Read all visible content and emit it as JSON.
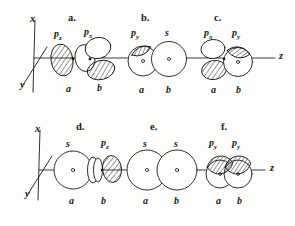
{
  "figure": {
    "background_color": "#fdfdfb",
    "ink_color": "#1a1a18"
  },
  "axes": {
    "row1": {
      "x_label": "x",
      "y_label": "y",
      "z_label": "z"
    },
    "row2": {
      "x_label": "x",
      "y_label": "y",
      "z_label": "z"
    }
  },
  "panels": [
    {
      "id": "panel-a",
      "letter": "a.",
      "orbital_labels": [
        "p",
        "p"
      ],
      "orbital_subscripts": [
        "z",
        "x"
      ],
      "site_labels": [
        "a",
        "b"
      ],
      "row": 1
    },
    {
      "id": "panel-b",
      "letter": "b.",
      "orbital_labels": [
        "p",
        "s"
      ],
      "orbital_subscripts": [
        "y",
        ""
      ],
      "site_labels": [
        "a",
        "b"
      ],
      "row": 1
    },
    {
      "id": "panel-c",
      "letter": "c.",
      "orbital_labels": [
        "p",
        "p"
      ],
      "orbital_subscripts": [
        "x",
        "y"
      ],
      "site_labels": [
        "a",
        "b"
      ],
      "row": 1
    },
    {
      "id": "panel-d",
      "letter": "d.",
      "orbital_labels": [
        "s",
        "p"
      ],
      "orbital_subscripts": [
        "",
        "z"
      ],
      "site_labels": [
        "a",
        "b"
      ],
      "row": 2
    },
    {
      "id": "panel-e",
      "letter": "e.",
      "orbital_labels": [
        "s",
        "s"
      ],
      "orbital_subscripts": [
        "",
        ""
      ],
      "site_labels": [
        "a",
        "b"
      ],
      "row": 2
    },
    {
      "id": "panel-f",
      "letter": "f.",
      "orbital_labels": [
        "p",
        "p"
      ],
      "orbital_subscripts": [
        "y",
        "y"
      ],
      "site_labels": [
        "a",
        "b"
      ],
      "row": 2
    }
  ]
}
